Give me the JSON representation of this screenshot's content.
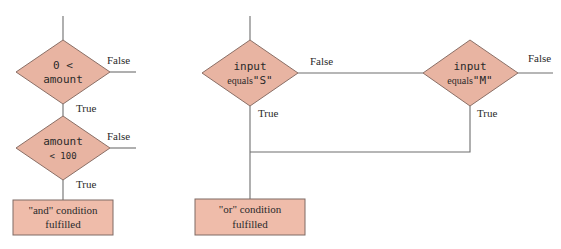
{
  "diagram": {
    "colors": {
      "decision_fill": "#e8b4a2",
      "process_fill": "#efbcaa",
      "line": "#6e6e6e"
    },
    "and_flow": {
      "decision1": {
        "line1": "0 <",
        "line2": "amount",
        "false_label": "False",
        "true_label": "True"
      },
      "decision2": {
        "line1": "amount",
        "line2": "< 100",
        "false_label": "False",
        "true_label": "True"
      },
      "result": {
        "line1": "\"and\" condition",
        "line2": "fulfilled"
      }
    },
    "or_flow": {
      "decision1": {
        "line1": "input",
        "line2_prefix": "equals",
        "line2_value": "\"S\"",
        "false_label": "False",
        "true_label": "True"
      },
      "decision2": {
        "line1": "input",
        "line2_prefix": "equals",
        "line2_value": "\"M\"",
        "false_label": "False",
        "true_label": "True"
      },
      "result": {
        "line1": "\"or\" condition",
        "line2": "fulfilled"
      }
    }
  }
}
